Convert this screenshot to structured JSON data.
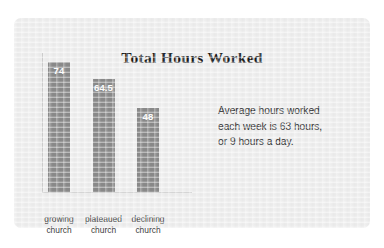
{
  "chart_data": {
    "type": "bar",
    "title": "Total Hours Worked",
    "categories": [
      "growing church",
      "plateaued church",
      "declining church"
    ],
    "category_lines": [
      [
        "growing",
        "church"
      ],
      [
        "plateaued",
        "church"
      ],
      [
        "declining",
        "church"
      ]
    ],
    "values": [
      74,
      64.5,
      48
    ],
    "value_labels": [
      "74",
      "64.5",
      "48"
    ],
    "xlabel": "",
    "ylabel": "",
    "ylim": [
      0,
      80
    ],
    "grid": false,
    "legend": false,
    "annotation": "Average hours worked each week is 63 hours, or 9 hours a day.",
    "annotation_lines": [
      "Average hours worked",
      "each week is 63 hours,",
      "or 9 hours a day."
    ],
    "colors": {
      "bar": "#8b8b8b",
      "panel_background": "#eeeeee",
      "page_background": "#ffffff",
      "axis": "#b9b9b9",
      "title_text": "#1b1b1b",
      "label_text": "#3a3a3a",
      "value_text": "#ffffff",
      "note_text": "#2d2d2d"
    }
  }
}
